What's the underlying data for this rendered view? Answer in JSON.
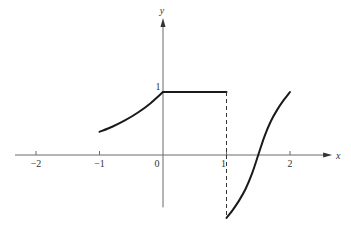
{
  "chart_data": {
    "type": "line",
    "title": "",
    "xlabel": "x",
    "ylabel": "y",
    "xlim": [
      -2.4,
      2.6
    ],
    "ylim": [
      -1.1,
      2.2
    ],
    "grid": false,
    "legend": "none",
    "x_ticks": [
      {
        "value": -2,
        "label": "−2"
      },
      {
        "value": -1,
        "label": "−1"
      },
      {
        "value": 0,
        "label": "0"
      },
      {
        "value": 1,
        "label": "1"
      },
      {
        "value": 2,
        "label": "2"
      }
    ],
    "y_ticks": [
      {
        "value": 1,
        "label": "1"
      }
    ],
    "y_axis_bottom": -0.8,
    "series": [
      {
        "name": "exp-segment",
        "style": "solid",
        "description": "y = e^x on [-1, 0]",
        "points": [
          [
            -1,
            0.368
          ],
          [
            -0.8,
            0.449
          ],
          [
            -0.6,
            0.549
          ],
          [
            -0.4,
            0.67
          ],
          [
            -0.2,
            0.819
          ],
          [
            0,
            1
          ]
        ]
      },
      {
        "name": "constant-segment",
        "style": "solid",
        "description": "y = 1 on [0, 1]",
        "points": [
          [
            0,
            1
          ],
          [
            1,
            1
          ]
        ]
      },
      {
        "name": "jump-discontinuity",
        "style": "dashed",
        "description": "vertical dashed line at x = 1",
        "points": [
          [
            1,
            1
          ],
          [
            1,
            -1
          ]
        ]
      },
      {
        "name": "s-curve-segment",
        "style": "solid",
        "description": "increasing S-shaped curve on [1, 2] from -1 to 1, crossing zero near x = 1.5",
        "points": [
          [
            1,
            -1
          ],
          [
            1.1,
            -0.87
          ],
          [
            1.2,
            -0.72
          ],
          [
            1.3,
            -0.54
          ],
          [
            1.4,
            -0.3
          ],
          [
            1.5,
            0
          ],
          [
            1.6,
            0.3
          ],
          [
            1.7,
            0.54
          ],
          [
            1.8,
            0.72
          ],
          [
            1.9,
            0.87
          ],
          [
            2,
            1
          ]
        ]
      }
    ]
  }
}
